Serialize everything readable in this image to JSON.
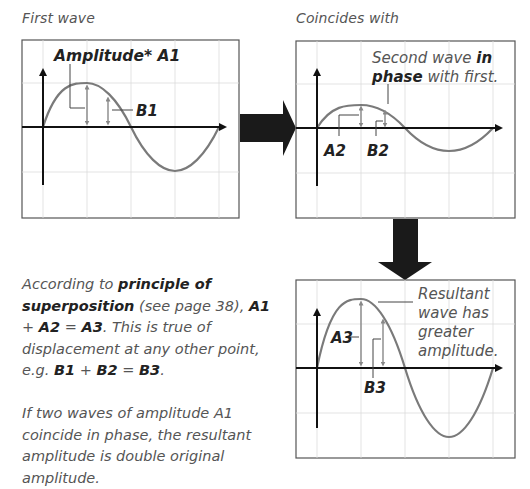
{
  "panels": {
    "first": {
      "caption": "First wave",
      "label_amplitude": "Amplitude*",
      "label_a": "A1",
      "label_b": "B1"
    },
    "second": {
      "caption": "Coincides with",
      "note_line1_pre": "Second wave ",
      "note_line1_bold": "in",
      "note_line2_bold": "phase",
      "note_line2_post": " with first.",
      "label_a": "A2",
      "label_b": "B2"
    },
    "resultant": {
      "note_lines": [
        "Resultant",
        "wave has",
        "greater",
        "amplitude."
      ],
      "label_a": "A3",
      "label_b": "B3"
    }
  },
  "explanation": {
    "p1": {
      "t1": "According to ",
      "b1": "principle of superposition",
      "t2": " (see page 38), ",
      "b2": "A1",
      "t3": " + ",
      "b3": "A2",
      "t4": " = ",
      "b4": "A3",
      "t5": ". This is true of displacement at any other point, e.g. ",
      "b5": "B1",
      "t6": " + ",
      "b6": "B2",
      "t7": " = ",
      "b7": "B3",
      "t8": "."
    },
    "p2": "If two waves of amplitude A1 coincide in phase, the resultant amplitude is double original amplitude."
  },
  "colors": {
    "wave": "#7a7a7a",
    "axis": "#111111",
    "grid": "#d8d8d8",
    "frame": "#555555",
    "arrow": "#1a1a1a"
  }
}
